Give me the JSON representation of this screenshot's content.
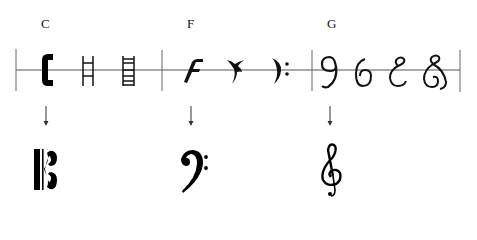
{
  "groups": [
    {
      "letter": "C",
      "historical_forms": [
        "filled C-shape",
        "ladder (2 rungs)",
        "ladder (many rungs)"
      ],
      "modern_clef": "C clef (alto/tenor)"
    },
    {
      "letter": "F",
      "historical_forms": [
        "gothic F",
        "hooked F with dot",
        "curved F with two dots"
      ],
      "modern_clef": "F clef (bass)"
    },
    {
      "letter": "G",
      "historical_forms": [
        "G as 9-shape",
        "G as 6-shape",
        "looped G",
        "looped G with tail"
      ],
      "modern_clef": "G clef (treble)"
    }
  ],
  "colors": {
    "ink": "#000000",
    "staff_line": "#555555",
    "barline": "#666666",
    "background": "#ffffff"
  }
}
